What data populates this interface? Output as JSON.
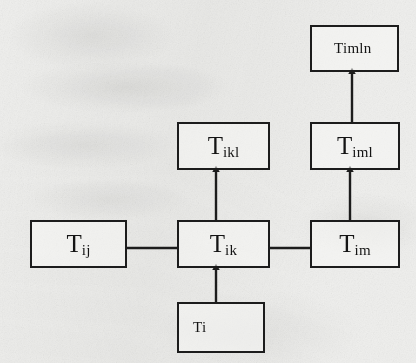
{
  "diagram": {
    "kind": "box-and-arrow hierarchy diagram on scanned paper",
    "background_color": "#efefed",
    "ink_color": "#1c1c1c",
    "nodes": [
      {
        "id": "timln",
        "name": "node-timln",
        "base": "Timln",
        "subscript": "",
        "style": "plain",
        "align": "mildleft",
        "x": 310,
        "y": 25,
        "w": 89,
        "h": 47
      },
      {
        "id": "tikl",
        "name": "node-tikl",
        "base": "T",
        "subscript": "ikl",
        "style": "sub",
        "align": "center",
        "x": 177,
        "y": 122,
        "w": 93,
        "h": 48
      },
      {
        "id": "timl",
        "name": "node-timl",
        "base": "T",
        "subscript": "iml",
        "style": "sub",
        "align": "center",
        "x": 310,
        "y": 122,
        "w": 90,
        "h": 48
      },
      {
        "id": "tij",
        "name": "node-tij",
        "base": "T",
        "subscript": "ij",
        "style": "sub",
        "align": "center",
        "x": 30,
        "y": 220,
        "w": 97,
        "h": 48
      },
      {
        "id": "tik",
        "name": "node-tik",
        "base": "T",
        "subscript": "ik",
        "style": "sub",
        "align": "center",
        "x": 177,
        "y": 220,
        "w": 93,
        "h": 48
      },
      {
        "id": "tim",
        "name": "node-tim",
        "base": "T",
        "subscript": "im",
        "style": "sub",
        "align": "center",
        "x": 310,
        "y": 220,
        "w": 90,
        "h": 48
      },
      {
        "id": "ti",
        "name": "node-ti",
        "base": "Ti",
        "subscript": "",
        "style": "plain",
        "align": "leftish",
        "x": 177,
        "y": 302,
        "w": 88,
        "h": 51
      }
    ],
    "edges": [
      {
        "id": "ti-to-tik",
        "name": "arrow-ti-to-tik",
        "from": "ti",
        "to": "tik",
        "kind": "arrow",
        "direction": "up",
        "x1": 216,
        "y1": 302,
        "x2": 216,
        "y2": 268
      },
      {
        "id": "tik-to-tikl",
        "name": "arrow-tik-to-tikl",
        "from": "tik",
        "to": "tikl",
        "kind": "arrow",
        "direction": "up",
        "x1": 216,
        "y1": 220,
        "x2": 216,
        "y2": 170
      },
      {
        "id": "tim-to-timl",
        "name": "arrow-tim-to-timl",
        "from": "tim",
        "to": "timl",
        "kind": "arrow",
        "direction": "up",
        "x1": 350,
        "y1": 220,
        "x2": 350,
        "y2": 170
      },
      {
        "id": "timl-to-timln",
        "name": "arrow-timl-to-timln",
        "from": "timl",
        "to": "timln",
        "kind": "arrow",
        "direction": "up",
        "x1": 352,
        "y1": 122,
        "x2": 352,
        "y2": 72
      },
      {
        "id": "tij-to-tik",
        "name": "connector-tij-to-tik",
        "from": "tij",
        "to": "tik",
        "kind": "line",
        "direction": "horizontal",
        "x1": 127,
        "y1": 248,
        "x2": 177,
        "y2": 248
      },
      {
        "id": "tik-to-tim",
        "name": "connector-tik-to-tim",
        "from": "tik",
        "to": "tim",
        "kind": "line",
        "direction": "horizontal",
        "x1": 270,
        "y1": 248,
        "x2": 310,
        "y2": 248
      }
    ]
  }
}
